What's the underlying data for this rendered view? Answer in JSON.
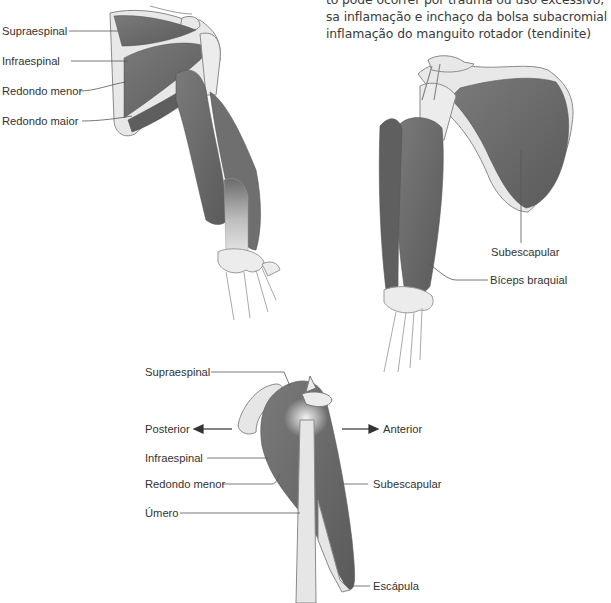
{
  "body_text": {
    "lines": [
      "to pode ocorrer por trauma ou uso excessivo,",
      "sa inflamação e inchaço da bolsa subacromial",
      "inflamação do manguito rotador (tendinite)"
    ]
  },
  "figure_posterior": {
    "labels": [
      "Supraespinal",
      "Infraespinal",
      "Redondo menor",
      "Redondo maior"
    ]
  },
  "figure_anterior": {
    "labels": [
      "Subescapular",
      "Bíceps braquial"
    ]
  },
  "figure_lateral": {
    "labels": {
      "supraespinal": "Supraespinal",
      "posterior": "Posterior",
      "anterior": "Anterior",
      "infraespinal": "Infraespinal",
      "redondo_menor": "Redondo menor",
      "umero": "Úmero",
      "subescapular": "Subescapular",
      "escapula": "Escápula"
    }
  },
  "colors": {
    "muscle": "#6b6b6b",
    "muscle_dark": "#555555",
    "bone": "#e6e6e6",
    "outline": "#8a8a8a",
    "text": "#333333"
  }
}
